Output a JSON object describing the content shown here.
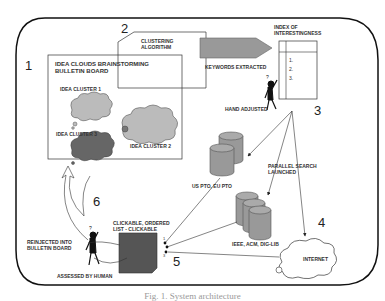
{
  "steps": {
    "s1": "1",
    "s2": "2",
    "s3": "3",
    "s4": "4",
    "s5": "5",
    "s6": "6"
  },
  "board": {
    "title_line1": "IDEA CLOUDS BRAINSTORMING",
    "title_line2": "BULLETIN BOARD",
    "clusters": [
      "IDEA CLUSTER 1",
      "IDEA CLUSTER 2",
      "IDEA CLUSTER 3"
    ]
  },
  "clustering": {
    "line1": "CLUSTERING",
    "line2": "ALGORITHM"
  },
  "keywords_label": "KEYWORDS EXTRACTED",
  "index": {
    "title_line1": "INDEX OF",
    "title_line2": "INTERESTINGNESS",
    "items": [
      "1.",
      "2.",
      "3."
    ]
  },
  "hand_adjusted_label": "HAND ADJUSTED",
  "parallel_search": {
    "line1": "PARALLEL SEARCH",
    "line2": "LAUNCHED"
  },
  "databases": {
    "patents": "US PTO, EU PTO",
    "literature": "IEEE, ACM, DIG-LIB",
    "internet": "INTERNET"
  },
  "result_list": {
    "line1": "CLICKABLE, ORDERED",
    "line2": "LIST - CLICKABLE",
    "ranks": [
      "1",
      "2",
      "3"
    ]
  },
  "reinjected": {
    "line1": "REINJECTED INTO",
    "line2": "BULLETIN BOARD"
  },
  "assessed_label": "ASSESSED BY HUMAN",
  "caption": "Fig. 1. System architecture"
}
